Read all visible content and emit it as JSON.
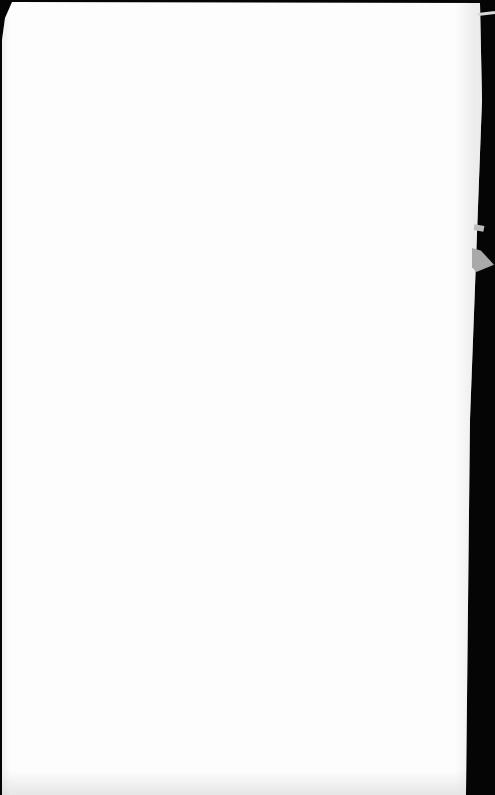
{
  "scene": {
    "description": "Photograph of a blank white sheet of paper on a dark background",
    "colors": {
      "paper": "#fdfdfd",
      "background": "#050505",
      "paper_edge_shadow": "#d8d8d8",
      "fold_flap": "#a9a9a9"
    },
    "text_content": []
  }
}
